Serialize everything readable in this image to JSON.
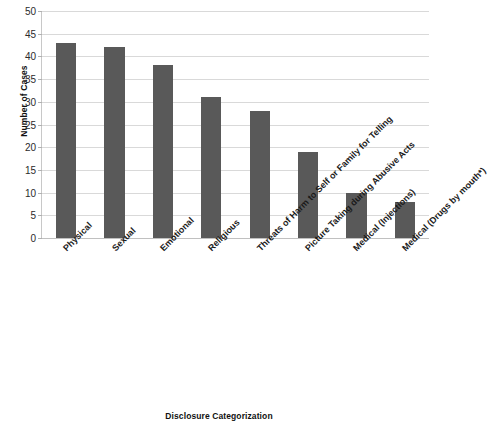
{
  "chart_data": {
    "type": "bar",
    "title": "",
    "xlabel": "Disclosure Categorization",
    "ylabel": "Number of Cases",
    "categories": [
      "Physical",
      "Sexual",
      "Emotional",
      "Religious",
      "Threats of Harm to Self or Family for Telling",
      "Picture Taking during Abusive Acts",
      "Medical (Injections)",
      "Medical (Drugs by mouth*)"
    ],
    "values": [
      43,
      42,
      38,
      31,
      28,
      19,
      10,
      8
    ],
    "ylim": [
      0,
      50
    ],
    "ytick_step": 5,
    "yticks": [
      0,
      5,
      10,
      15,
      20,
      25,
      30,
      35,
      40,
      45,
      50
    ],
    "ytick_labels": [
      "0",
      "5",
      "10",
      "15",
      "20",
      "25",
      "30",
      "35",
      "40",
      "45",
      "50"
    ],
    "grid": true,
    "legend": "none",
    "bar_color": "#595959",
    "gridline_color": "#d9d9d9",
    "background_color": "#ffffff",
    "label_rotation_degrees": -45
  }
}
